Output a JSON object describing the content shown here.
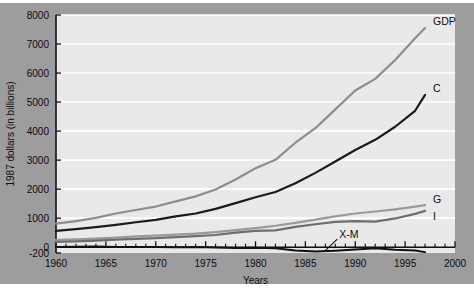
{
  "chart_data": {
    "type": "line",
    "title": "",
    "xlabel": "Years",
    "ylabel": "1987 dollars (in billions)",
    "xlim": [
      1960,
      2000
    ],
    "ylim": [
      -200,
      8000
    ],
    "grid": true,
    "legend_position": "line-end-labels",
    "x_ticks": [
      "1960",
      "1965",
      "1970",
      "1975",
      "1980",
      "1985",
      "1990",
      "1995",
      "2000"
    ],
    "x_tick_values": [
      1960,
      1965,
      1970,
      1975,
      1980,
      1985,
      1990,
      1995,
      2000
    ],
    "y_ticks": [
      "-200",
      "0",
      "1000",
      "2000",
      "3000",
      "4000",
      "5000",
      "6000",
      "7000",
      "8000"
    ],
    "y_tick_values": [
      -200,
      0,
      1000,
      2000,
      3000,
      4000,
      5000,
      6000,
      7000,
      8000
    ],
    "x": [
      1960,
      1962,
      1964,
      1966,
      1968,
      1970,
      1972,
      1974,
      1976,
      1978,
      1980,
      1982,
      1984,
      1986,
      1988,
      1990,
      1992,
      1994,
      1996,
      1997
    ],
    "series": [
      {
        "name": "GDP",
        "label": "GDP",
        "color": "#8e8e8e",
        "values": [
          810,
          900,
          1010,
          1160,
          1280,
          1400,
          1580,
          1750,
          1990,
          2330,
          2720,
          3010,
          3600,
          4100,
          4750,
          5400,
          5800,
          6450,
          7200,
          7550
        ]
      },
      {
        "name": "C",
        "label": "C",
        "color": "#1a1a1a",
        "values": [
          560,
          620,
          690,
          770,
          860,
          940,
          1060,
          1160,
          1320,
          1520,
          1720,
          1900,
          2200,
          2560,
          2950,
          3350,
          3700,
          4150,
          4700,
          5250
        ]
      },
      {
        "name": "G",
        "label": "G",
        "color": "#9a9a9a",
        "values": [
          250,
          270,
          295,
          330,
          370,
          400,
          430,
          470,
          520,
          590,
          660,
          740,
          840,
          950,
          1060,
          1160,
          1230,
          1300,
          1400,
          1450
        ]
      },
      {
        "name": "I",
        "label": "I",
        "color": "#6d6d6d",
        "values": [
          180,
          200,
          225,
          260,
          290,
          310,
          350,
          380,
          420,
          500,
          560,
          580,
          700,
          790,
          870,
          900,
          880,
          990,
          1150,
          1250
        ]
      },
      {
        "name": "X-M",
        "label": "X-M",
        "color": "#111111",
        "values": [
          10,
          15,
          20,
          10,
          5,
          10,
          -5,
          5,
          -10,
          -25,
          -20,
          -35,
          -110,
          -150,
          -120,
          -80,
          -40,
          -90,
          -110,
          -170
        ]
      }
    ],
    "annotations": [
      {
        "text": "X-M",
        "kind": "leader-label"
      }
    ]
  }
}
